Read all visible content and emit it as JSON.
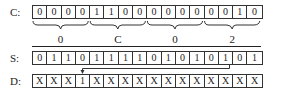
{
  "rows": {
    "C": {
      "label": "C:",
      "cells": [
        "0",
        "0",
        "0",
        "0",
        "1",
        "1",
        "0",
        "0",
        "0",
        "0",
        "0",
        "0",
        "0",
        "0",
        "1",
        "0"
      ]
    },
    "S": {
      "label": "S:",
      "cells": [
        "0",
        "1",
        "1",
        "0",
        "1",
        "1",
        "1",
        "1",
        "0",
        "1",
        "0",
        "1",
        "0",
        "1",
        "0",
        "1"
      ]
    },
    "D": {
      "label": "D:",
      "cells": [
        "X",
        "X",
        "X",
        "1",
        "X",
        "X",
        "X",
        "X",
        "X",
        "X",
        "X",
        "X",
        "X",
        "X",
        "X",
        "X"
      ]
    }
  },
  "groups": [
    {
      "label": "0",
      "start": 0,
      "end": 3
    },
    {
      "label": "C",
      "start": 4,
      "end": 7
    },
    {
      "label": "0",
      "start": 8,
      "end": 11
    },
    {
      "label": "2",
      "start": 12,
      "end": 15
    }
  ],
  "arrow": {
    "from_row": "S",
    "from_index": 13,
    "to_row": "D",
    "to_index": 3
  }
}
